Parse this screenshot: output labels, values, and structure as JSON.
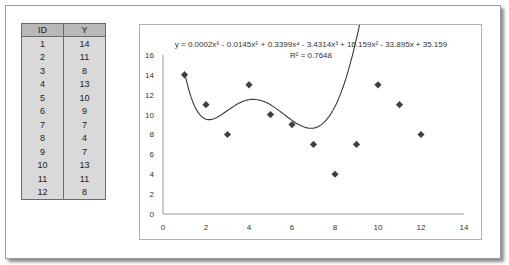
{
  "table": {
    "headers": [
      "ID",
      "Y"
    ],
    "rows": [
      [
        "1",
        "14"
      ],
      [
        "2",
        "11"
      ],
      [
        "3",
        "8"
      ],
      [
        "4",
        "13"
      ],
      [
        "5",
        "10"
      ],
      [
        "6",
        "9"
      ],
      [
        "7",
        "7"
      ],
      [
        "8",
        "4"
      ],
      [
        "9",
        "7"
      ],
      [
        "10",
        "13"
      ],
      [
        "11",
        "11"
      ],
      [
        "12",
        "8"
      ]
    ]
  },
  "chart": {
    "equation": "y = 0.0002x⁶ - 0.0145x⁵ + 0.3399x⁴ - 3.4314x³ + 16.159x² - 33.895x + 35.159",
    "r_squared": "R² = 0.7648",
    "y_ticks": [
      "0",
      "2",
      "4",
      "6",
      "8",
      "10",
      "12",
      "14",
      "16"
    ],
    "x_ticks": [
      "0",
      "2",
      "4",
      "6",
      "8",
      "10",
      "12",
      "14"
    ]
  },
  "chart_data": {
    "type": "scatter",
    "title": "",
    "xlabel": "",
    "ylabel": "",
    "x": [
      1,
      2,
      3,
      4,
      5,
      6,
      7,
      8,
      9,
      10,
      11,
      12
    ],
    "y": [
      14,
      11,
      8,
      13,
      10,
      9,
      7,
      4,
      7,
      13,
      11,
      8
    ],
    "xlim": [
      0,
      14
    ],
    "ylim": [
      0,
      16
    ],
    "grid": false,
    "legend": "none",
    "marker": "diamond",
    "marker_color": "#404040",
    "trendline": {
      "type": "polynomial",
      "order": 6,
      "coefficients": [
        0.0002,
        -0.0145,
        0.3399,
        -3.4314,
        16.159,
        -33.895,
        35.159
      ],
      "equation": "y = 0.0002x⁶ - 0.0145x⁵ + 0.3399x⁴ - 3.4314x³ + 16.159x² - 33.895x + 35.159",
      "r_squared": 0.7648,
      "color": "#404040"
    }
  }
}
